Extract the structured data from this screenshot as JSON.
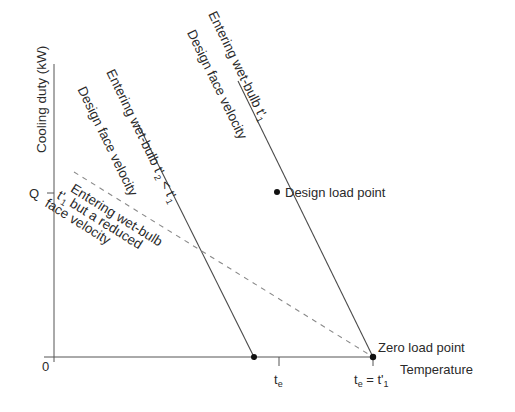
{
  "figure": {
    "y_axis_label": "Cooling duty (kW)",
    "x_axis_label": "Temperature",
    "origin_label": "0",
    "q_label": "Q",
    "te_label": "t",
    "te_sub": "e",
    "te_eq_label_t": "t",
    "te_eq_label_sub": "e",
    "te_eq_label_rest": " = t'",
    "te_eq_label_sub2": "1",
    "line1": {
      "line_a": "Entering wet-bulb t'",
      "line_a_sub": "1",
      "line_b": "Design face velocity"
    },
    "line2": {
      "line_a": "Entering wet-bulb t'",
      "line_a_sub": "2",
      "line_a_rest": " < t'",
      "line_a_sub2": "1",
      "line_b": "Design face velocity"
    },
    "dashed": {
      "line_a": "Entering wet-bulb",
      "line_b": "t'",
      "line_b_sub": "1",
      "line_b_rest": " but a reduced",
      "line_c": "face velocity"
    },
    "design_load_point": "Design load point",
    "zero_load_point": "Zero load point",
    "colors": {
      "line": "#4a4a4a",
      "dashed": "#8a8a8a",
      "point": "#111111"
    }
  }
}
